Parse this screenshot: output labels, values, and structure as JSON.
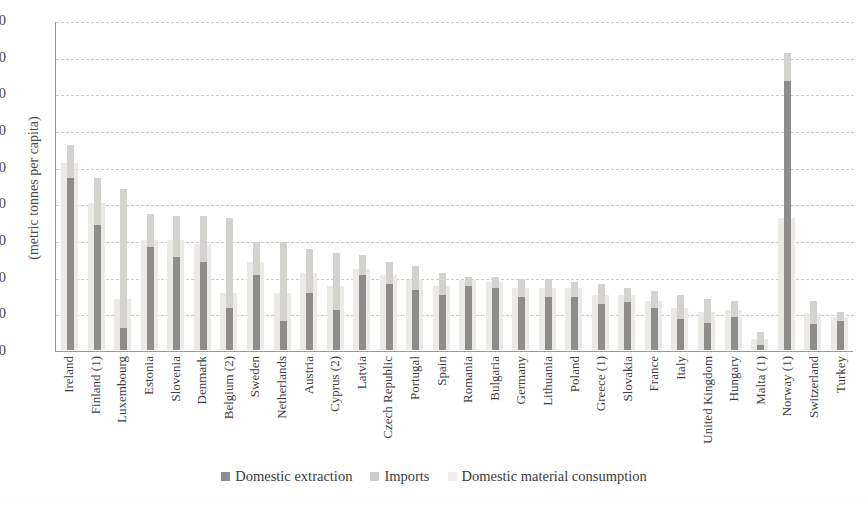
{
  "chart_data": {
    "type": "bar",
    "title": "",
    "subtitle": "",
    "xlabel": "",
    "ylabel": "(metric tonnes per capita)",
    "ylim": [
      0,
      90
    ],
    "yticks": [
      0,
      10,
      20,
      30,
      40,
      50,
      60,
      70,
      80,
      90
    ],
    "grid": true,
    "legend_position": "bottom",
    "categories": [
      "Ireland",
      "Finland (1)",
      "Luxembourg",
      "Estonia",
      "Slovenia",
      "Denmark",
      "Belgium (2)",
      "Sweden",
      "Netherlands",
      "Austria",
      "Cyprus (2)",
      "Latvia",
      "Czech Republic",
      "Portugal",
      "Spain",
      "Romania",
      "Bulgaria",
      "Germany",
      "Lithuania",
      "Poland",
      "Greece (1)",
      "Slovakia",
      "France",
      "Italy",
      "United Kingdom",
      "Hungary",
      "Malta (1)",
      "Norway (1)",
      "Switzerland",
      "Turkey"
    ],
    "series": [
      {
        "name": "Domestic extraction",
        "color": "#8e8d8b",
        "values": [
          47,
          34,
          6,
          28,
          25.5,
          24,
          11.5,
          20.5,
          8,
          15.5,
          11,
          20.5,
          18,
          16.5,
          15,
          17.5,
          17,
          14.5,
          14.5,
          14.5,
          12.5,
          13,
          11.5,
          8.5,
          7.5,
          9,
          1.5,
          73.5,
          7,
          8
        ]
      },
      {
        "name": "Imports",
        "color": "#d4d2cf",
        "values": [
          56,
          47,
          44,
          37,
          36.5,
          36.5,
          36,
          29.5,
          29.5,
          27.5,
          26.5,
          26,
          24,
          23,
          21,
          20,
          20,
          19.5,
          19.5,
          18.5,
          18,
          17,
          16,
          15,
          14,
          13.5,
          5,
          81,
          13.5,
          10.5
        ]
      },
      {
        "name": "Domestic material consumption",
        "color": "#eceae7",
        "values": [
          51,
          40,
          14,
          30,
          30,
          29,
          15.5,
          24,
          15.5,
          21,
          17.5,
          22,
          20.5,
          19,
          17.5,
          19,
          18.5,
          17,
          17,
          17,
          15,
          15,
          13.5,
          11.5,
          10.5,
          11,
          3,
          36,
          10,
          9
        ]
      }
    ]
  },
  "legend": {
    "items": [
      {
        "label": "Domestic extraction",
        "swatch": "dark-gray-square"
      },
      {
        "label": "Imports",
        "swatch": "medium-gray-square"
      },
      {
        "label": "Domestic material consumption",
        "swatch": "light-gray-square"
      }
    ]
  }
}
